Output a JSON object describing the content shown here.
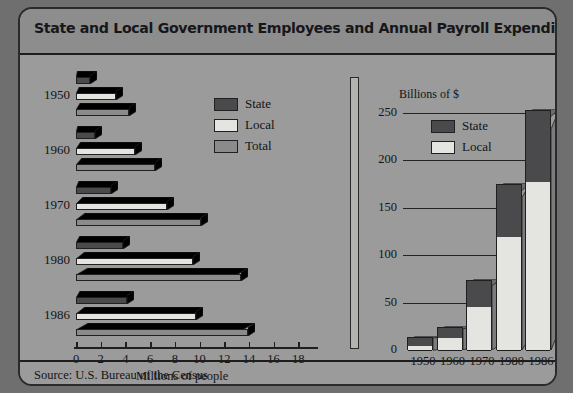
{
  "header": {
    "title": "State and Local Government Employees and Annual Payroll Expenditures"
  },
  "source": {
    "text": "Source: U.S. Bureau of the Census"
  },
  "colors": {
    "state": "#4a4a4d",
    "local": "#e4e4e0",
    "total": "#8b8b8b",
    "card_background": "#9b9b9b",
    "title_band": "#8d8d8d",
    "outline": "#1d1d1d"
  },
  "left": {
    "legend": [
      {
        "label": "State",
        "key": "state"
      },
      {
        "label": "Local",
        "key": "local"
      },
      {
        "label": "Total",
        "key": "total"
      }
    ],
    "axis_title": "Millions of people",
    "tick_labels": [
      "0",
      "2",
      "4",
      "6",
      "8",
      "10",
      "12",
      "14",
      "16",
      "18"
    ],
    "categories": [
      "1950",
      "1960",
      "1970",
      "1980",
      "1986"
    ]
  },
  "right": {
    "axis_title": "Billions of $",
    "legend": [
      {
        "label": "State",
        "key": "state"
      },
      {
        "label": "Local",
        "key": "local"
      }
    ],
    "tick_labels": [
      "250",
      "200",
      "150",
      "100",
      "50",
      "0"
    ],
    "categories": [
      "1950",
      "1960",
      "1970",
      "1980",
      "1986"
    ]
  },
  "chart_data": [
    {
      "id": "employees",
      "type": "bar",
      "orientation": "horizontal",
      "title": "State and Local Government Employees",
      "xlabel": "Millions of people",
      "ylabel": "",
      "xlim": [
        0,
        19
      ],
      "xticks": [
        0,
        2,
        4,
        6,
        8,
        10,
        12,
        14,
        16,
        18
      ],
      "grid": false,
      "legend_position": "inside-right",
      "categories": [
        "1950",
        "1960",
        "1970",
        "1980",
        "1986"
      ],
      "series": [
        {
          "name": "State",
          "values": [
            1.1,
            1.5,
            2.8,
            3.8,
            4.1
          ]
        },
        {
          "name": "Local",
          "values": [
            3.2,
            4.8,
            7.4,
            9.5,
            9.7
          ]
        },
        {
          "name": "Total",
          "values": [
            4.3,
            6.4,
            10.1,
            13.4,
            13.9
          ]
        }
      ]
    },
    {
      "id": "payroll",
      "type": "bar",
      "orientation": "vertical",
      "stacked": true,
      "title": "Annual Payroll Expenditures",
      "xlabel": "",
      "ylabel": "Billions of $",
      "ylim": [
        0,
        255
      ],
      "yticks": [
        0,
        50,
        100,
        150,
        200,
        250
      ],
      "grid": true,
      "legend_position": "upper-left",
      "categories": [
        "1950",
        "1960",
        "1970",
        "1980",
        "1986"
      ],
      "series": [
        {
          "name": "Local",
          "values": [
            5,
            14,
            46,
            120,
            178
          ]
        },
        {
          "name": "State",
          "values": [
            9,
            10,
            28,
            55,
            75
          ]
        }
      ],
      "totals": [
        14,
        24,
        74,
        175,
        253
      ]
    }
  ]
}
